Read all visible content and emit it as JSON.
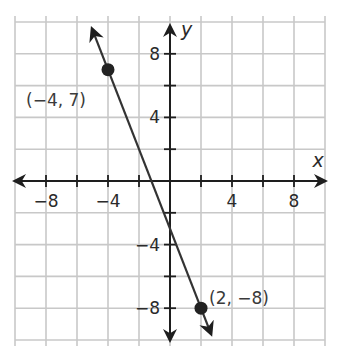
{
  "chart_data": {
    "type": "line",
    "title": "",
    "xlabel": "x",
    "ylabel": "y",
    "xlim": [
      -10,
      10
    ],
    "ylim": [
      -10,
      10
    ],
    "grid": true,
    "grid_step": 2,
    "x_ticks": [
      -8,
      -4,
      4,
      8
    ],
    "y_ticks": [
      8,
      4,
      -4,
      -8
    ],
    "x_tick_labels": [
      "−8",
      "−4",
      "4",
      "8"
    ],
    "y_tick_labels": [
      "8",
      "4",
      "−4",
      "−8"
    ],
    "series": [
      {
        "name": "line",
        "slope": -2.5,
        "intercept": -3,
        "points": [
          {
            "x": -4,
            "y": 7,
            "label": "(−4, 7)"
          },
          {
            "x": 2,
            "y": -8,
            "label": "(2, −8)"
          }
        ]
      }
    ],
    "colors": {
      "grid": "#c8c8c8",
      "axis": "#1e1e1e",
      "line": "#333333",
      "point": "#222222"
    }
  }
}
